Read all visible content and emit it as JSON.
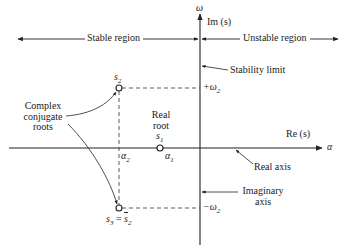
{
  "diagram": {
    "axes": {
      "vertical": {
        "symbol": "ω",
        "label": "Im (s)"
      },
      "horizontal": {
        "symbol": "α",
        "label": "Re (s)"
      }
    },
    "regions": {
      "stable": "Stable region",
      "unstable": "Unstable region"
    },
    "annotations": {
      "stability_limit": "Stability limit",
      "real_axis": "Real axis",
      "imaginary_axis_line1": "Imaginary",
      "imaginary_axis_line2": "axis",
      "complex_line1": "Complex",
      "complex_line2": "conjugate",
      "complex_line3": "roots",
      "real_root_line1": "Real",
      "real_root_line2": "root"
    },
    "points": {
      "s1": {
        "label": "s",
        "sub": "1",
        "alpha_label": "α",
        "alpha_sub": "1"
      },
      "s2": {
        "label": "s",
        "sub": "2",
        "alpha_label": "α",
        "alpha_sub": "2"
      },
      "s3": {
        "label": "s",
        "sub": "3",
        "eq": " = ",
        "conj": "s",
        "conj_sub": "2"
      }
    },
    "ticks": {
      "plus_omega": "+ω",
      "plus_omega_sub": "2",
      "minus_omega": "−ω",
      "minus_omega_sub": "2"
    },
    "colors": {
      "ink": "#222222",
      "background": "#ffffff"
    }
  }
}
